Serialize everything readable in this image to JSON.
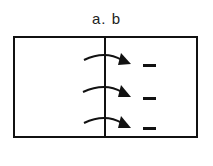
{
  "diagram": {
    "label": "a. b",
    "box": {
      "x": 14,
      "y": 37,
      "width": 183,
      "height": 100
    },
    "divider_x": 105,
    "arrows": [
      {
        "id": 1,
        "y": 60,
        "direction": "right",
        "sign": "−"
      },
      {
        "id": 2,
        "y": 92,
        "direction": "right",
        "sign": "−"
      },
      {
        "id": 3,
        "y": 123,
        "direction": "right",
        "sign": "−"
      }
    ],
    "colors": {
      "stroke": "#111111",
      "background": "#ffffff"
    }
  }
}
